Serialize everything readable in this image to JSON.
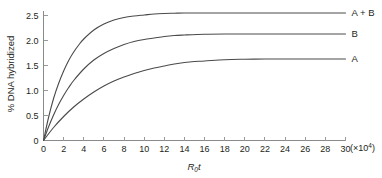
{
  "chart_data": {
    "type": "line",
    "title": "",
    "subtitle": "",
    "xlabel": "R₀t",
    "xlabel_parts": {
      "symbol": "R",
      "subscript": "0",
      "variable": "t"
    },
    "ylabel": "% DNA hybridized",
    "x_multiplier_note": "(×10⁴)",
    "x_multiplier_parts": {
      "prefix": "(×10",
      "exponent": "4",
      "suffix": ")"
    },
    "xlim": [
      0,
      30
    ],
    "ylim": [
      0,
      2.6
    ],
    "x_ticks": [
      0,
      2,
      4,
      6,
      8,
      10,
      12,
      14,
      16,
      18,
      20,
      22,
      24,
      26,
      28,
      30
    ],
    "x_tick_labels": [
      "0",
      "2",
      "4",
      "6",
      "8",
      "10",
      "12",
      "14",
      "16",
      "18",
      "20",
      "22",
      "24",
      "26",
      "28",
      "30"
    ],
    "y_ticks": [
      0,
      0.5,
      1.0,
      1.5,
      2.0,
      2.5
    ],
    "y_tick_labels": [
      "0",
      "0.5",
      "1.0",
      "1.5",
      "2.0",
      "2.5"
    ],
    "grid": false,
    "legend_position": "right-inline-labels",
    "series": [
      {
        "name": "A + B",
        "label": "A + B",
        "plateau": 2.55,
        "half_saturation_x": 3.2,
        "color": "#4a4a4a",
        "x": [
          0,
          0.5,
          1,
          1.5,
          2,
          2.5,
          3,
          3.5,
          4,
          5,
          6,
          7,
          8,
          9,
          10,
          11,
          12,
          13,
          14,
          16,
          18,
          20,
          22,
          24,
          26,
          28,
          30
        ],
        "y": [
          0,
          0.46,
          0.84,
          1.14,
          1.39,
          1.6,
          1.77,
          1.91,
          2.03,
          2.21,
          2.33,
          2.41,
          2.46,
          2.49,
          2.51,
          2.53,
          2.54,
          2.545,
          2.55,
          2.55,
          2.55,
          2.55,
          2.55,
          2.55,
          2.55,
          2.55,
          2.55
        ]
      },
      {
        "name": "B",
        "label": "B",
        "plateau": 2.13,
        "half_saturation_x": 5.2,
        "color": "#4a4a4a",
        "x": [
          0,
          0.5,
          1,
          1.5,
          2,
          2.5,
          3,
          4,
          5,
          6,
          7,
          8,
          9,
          10,
          11,
          12,
          13,
          14,
          16,
          18,
          20,
          22,
          24,
          26,
          28,
          30
        ],
        "y": [
          0,
          0.27,
          0.51,
          0.72,
          0.9,
          1.06,
          1.2,
          1.43,
          1.61,
          1.74,
          1.84,
          1.92,
          1.98,
          2.02,
          2.05,
          2.08,
          2.1,
          2.11,
          2.125,
          2.13,
          2.13,
          2.13,
          2.13,
          2.13,
          2.13,
          2.13
        ]
      },
      {
        "name": "A",
        "label": "A",
        "plateau": 1.63,
        "half_saturation_x": 7.6,
        "color": "#4a4a4a",
        "x": [
          0,
          1,
          2,
          3,
          4,
          5,
          6,
          7,
          8,
          9,
          10,
          11,
          12,
          13,
          14,
          15,
          16,
          18,
          20,
          22,
          24,
          26,
          28,
          30
        ],
        "y": [
          0,
          0.26,
          0.48,
          0.67,
          0.83,
          0.97,
          1.09,
          1.19,
          1.27,
          1.34,
          1.4,
          1.45,
          1.49,
          1.53,
          1.56,
          1.58,
          1.59,
          1.615,
          1.625,
          1.63,
          1.63,
          1.63,
          1.63,
          1.63
        ]
      }
    ],
    "annotations": [
      {
        "text": "A + B",
        "x": 30.6,
        "y": 2.55
      },
      {
        "text": "B",
        "x": 30.6,
        "y": 2.13
      },
      {
        "text": "A",
        "x": 30.6,
        "y": 1.63
      }
    ]
  }
}
